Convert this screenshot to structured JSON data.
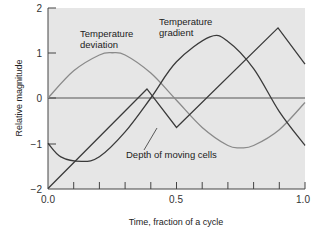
{
  "chart_data": {
    "type": "line",
    "title": "",
    "xlabel": "Time, fraction of a cycle",
    "ylabel": "Relative magnitude",
    "xlim": [
      0.0,
      1.0
    ],
    "ylim": [
      -2,
      2
    ],
    "x_tick_labels": [
      "0.0",
      "0.5",
      "1.0"
    ],
    "x_minor_ticks": [
      0.1,
      0.2,
      0.3,
      0.4,
      0.5,
      0.6,
      0.7,
      0.8,
      0.9,
      1.0
    ],
    "y_tick_labels": [
      "2",
      "1",
      "0",
      "-1",
      "-2"
    ],
    "grid": false,
    "zero_line": true,
    "series": [
      {
        "name": "Temperature deviation",
        "color": "#8a8a8a",
        "x": [
          0.0,
          0.1,
          0.2,
          0.25,
          0.3,
          0.4,
          0.5,
          0.6,
          0.7,
          0.75,
          0.8,
          0.9,
          1.0
        ],
        "y": [
          0.0,
          0.6,
          0.95,
          1.0,
          0.95,
          0.55,
          -0.05,
          -0.65,
          -1.05,
          -1.1,
          -1.05,
          -0.7,
          -0.1
        ]
      },
      {
        "name": "Temperature gradient",
        "color": "#3a3a3a",
        "x": [
          0.0,
          0.05,
          0.13,
          0.2,
          0.3,
          0.4,
          0.5,
          0.63,
          0.7,
          0.8,
          0.9,
          1.0
        ],
        "y": [
          -1.0,
          -1.3,
          -1.4,
          -1.3,
          -0.75,
          0.0,
          0.8,
          1.35,
          1.25,
          0.65,
          -0.3,
          -1.05
        ]
      },
      {
        "name": "Depth of moving cells",
        "color": "#3a3a3a",
        "x": [
          0.0,
          0.385,
          0.5,
          0.895,
          1.0
        ],
        "y": [
          -2.0,
          0.2,
          -0.65,
          1.55,
          0.75
        ]
      }
    ],
    "annotations": [
      {
        "text": "Temperature deviation",
        "lines": [
          "Temperature",
          "deviation"
        ]
      },
      {
        "text": "Temperature gradient",
        "lines": [
          "Temperature",
          "gradient"
        ]
      },
      {
        "text": "Depth of moving cells",
        "lines": [
          "Depth of moving cells"
        ]
      }
    ]
  },
  "labels": {
    "xlabel": "Time, fraction of a cycle",
    "ylabel": "Relative magnitude",
    "ann_dev_1": "Temperature",
    "ann_dev_2": "deviation",
    "ann_grad_1": "Temperature",
    "ann_grad_2": "gradient",
    "ann_depth": "Depth of moving cells",
    "x0": "0.0",
    "x05": "0.5",
    "x1": "1.0",
    "y2": "2",
    "y1": "1",
    "y0": "0",
    "ym1": "−1",
    "ym2": "−2"
  }
}
